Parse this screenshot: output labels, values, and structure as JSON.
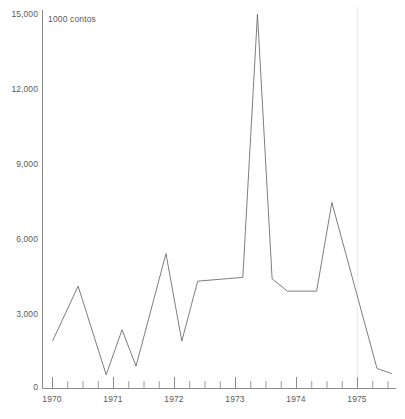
{
  "chart_data": {
    "type": "line",
    "title": "",
    "subtitle": "",
    "xlabel": "",
    "ylabel": "1000 contos",
    "axis_unit_label": "1000 contos",
    "legend": [],
    "legend_position": "none",
    "grid": false,
    "xlim": [
      1970.0,
      1975.5
    ],
    "ylim": [
      0,
      15000
    ],
    "y_ticks": [
      0,
      3000,
      6000,
      9000,
      12000,
      15000
    ],
    "y_tick_labels": [
      "0",
      "3,000",
      "6,000",
      "9,000",
      "12,000",
      "15,000"
    ],
    "x_ticks": [
      1970,
      1971,
      1972,
      1973,
      1974,
      1975
    ],
    "x_tick_labels": [
      "1970",
      "1971",
      "1972",
      "1973",
      "1974",
      "1975"
    ],
    "x_minor_tick_interval": 0.25,
    "series": [
      {
        "name": "1000 contos",
        "color": "#6e6e6e",
        "x": [
          1970.0,
          1970.42,
          1970.88,
          1971.14,
          1971.37,
          1971.86,
          1972.12,
          1972.38,
          1972.87,
          1973.12,
          1973.36,
          1973.6,
          1973.85,
          1974.33,
          1974.58,
          1975.32,
          1975.56
        ],
        "values": [
          1900,
          4100,
          550,
          2350,
          900,
          5400,
          1900,
          4300,
          4400,
          4450,
          15000,
          4400,
          3900,
          3900,
          7450,
          800,
          600
        ]
      }
    ],
    "annotations": []
  },
  "top_cut_text": "",
  "colors": {
    "axis": "#8a8a8a",
    "line": "#6e6e6e",
    "text": "#5a5a5a",
    "background": "#ffffff"
  }
}
